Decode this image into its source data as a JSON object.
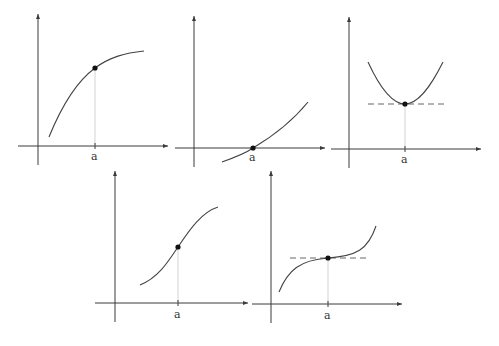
{
  "figure": {
    "colors": {
      "axis": "#3a3a3a",
      "curve": "#444444",
      "point": "#111111",
      "guide": "#c8c8c8",
      "tangent": "#666666"
    },
    "panels": [
      {
        "id": "increasing-concave",
        "x_label": "a",
        "point": "on-curve",
        "tangent": false
      },
      {
        "id": "zero-crossing",
        "x_label": "a",
        "point": "on-axis",
        "tangent": false
      },
      {
        "id": "local-minimum",
        "x_label": "a",
        "point": "minimum",
        "tangent": true
      },
      {
        "id": "inflection-increasing",
        "x_label": "a",
        "point": "inflection",
        "tangent": false
      },
      {
        "id": "stationary-inflection",
        "x_label": "a",
        "point": "stationary-inflection",
        "tangent": true
      }
    ]
  }
}
